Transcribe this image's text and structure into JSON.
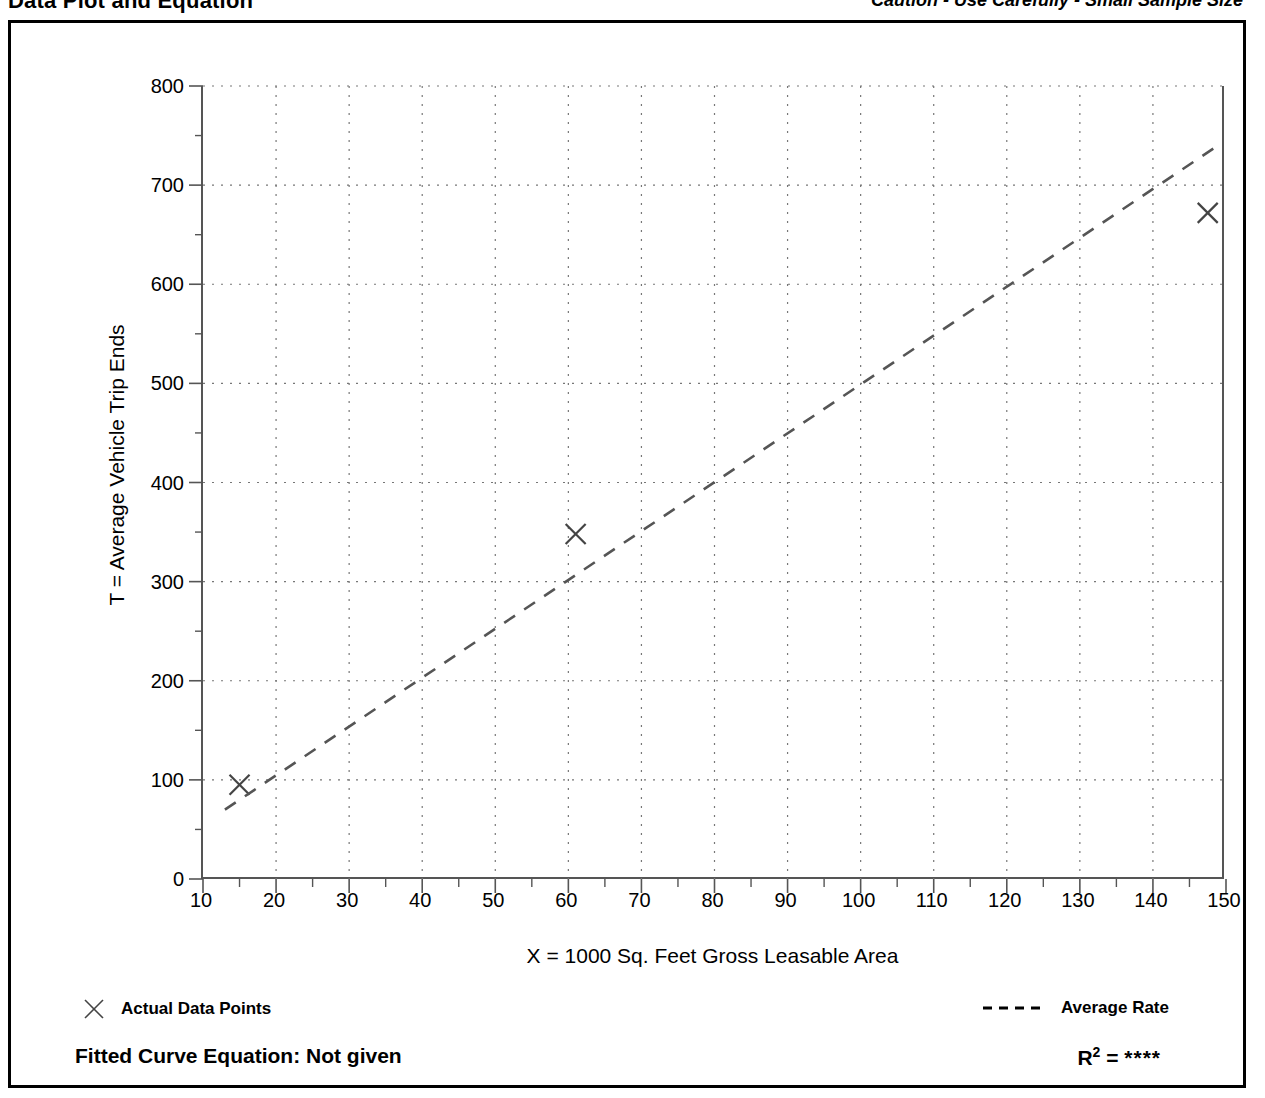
{
  "header": {
    "title": "Data Plot and Equation",
    "caution": "Caution - Use Carefully - Small Sample Size"
  },
  "legend": {
    "points_label": "Actual Data Points",
    "points_marker": "x-marker-icon",
    "rate_label": "Average Rate",
    "rate_marker": "dashed-line-icon"
  },
  "equation": {
    "fitted_label": "Fitted Curve Equation:  Not given",
    "r_squared_prefix": "R",
    "r_squared_exponent": "2",
    "r_squared_equals": " = ",
    "r_squared_value": "****"
  },
  "colors": {
    "ink": "#000000",
    "axis": "#555555",
    "grid": "#777777",
    "trend": "#555555",
    "marker": "#444444"
  },
  "chart_data": {
    "type": "scatter",
    "title": "Data Plot and Equation",
    "xlabel": "X = 1000 Sq. Feet Gross Leasable Area",
    "ylabel": "T = Average Vehicle Trip Ends",
    "xlim": [
      10,
      150
    ],
    "ylim": [
      0,
      800
    ],
    "xticks": [
      10,
      20,
      30,
      40,
      50,
      60,
      70,
      80,
      90,
      100,
      110,
      120,
      130,
      140,
      150
    ],
    "yticks": [
      0,
      100,
      200,
      300,
      400,
      500,
      600,
      700,
      800
    ],
    "x_minor_step": 5,
    "y_minor_step": 50,
    "grid": true,
    "grid_style": "dotted",
    "legend_position": "below-plot",
    "series": [
      {
        "name": "Actual Data Points",
        "type": "scatter",
        "marker": "x",
        "points": [
          {
            "x": 15,
            "y": 95
          },
          {
            "x": 61,
            "y": 348
          },
          {
            "x": 147.5,
            "y": 672
          }
        ]
      },
      {
        "name": "Average Rate",
        "type": "line",
        "style": "dashed",
        "endpoints": [
          {
            "x": 13,
            "y": 70
          },
          {
            "x": 148.5,
            "y": 738
          }
        ]
      }
    ]
  }
}
